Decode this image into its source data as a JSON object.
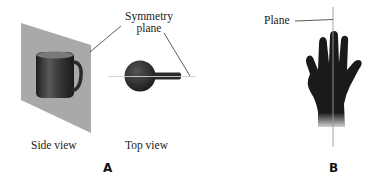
{
  "figure": {
    "panel_a": {
      "letter": "A",
      "callout": [
        "Symmetry",
        "plane"
      ],
      "side_view_label": "Side view",
      "top_view_label": "Top view",
      "subject": "mug"
    },
    "panel_b": {
      "letter": "B",
      "callout": "Plane",
      "subject": "hand"
    },
    "colors": {
      "plane_gray": "#a9a9a9",
      "object_dark": "#2e2e2e",
      "line_gray": "#9a9a9a",
      "text": "#222222"
    }
  }
}
